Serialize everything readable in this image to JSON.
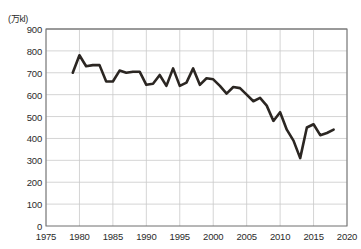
{
  "chart_data": {
    "type": "line",
    "title": "",
    "xlabel": "",
    "ylabel": "",
    "unit_label": "(万kl)",
    "xlim": [
      1975,
      2020
    ],
    "ylim": [
      0,
      900
    ],
    "grid": true,
    "legend": "none",
    "y_ticks": [
      900,
      800,
      700,
      600,
      500,
      400,
      300,
      200,
      100,
      0
    ],
    "x_ticks": [
      1975,
      1980,
      1985,
      1990,
      1995,
      2000,
      2005,
      2010,
      2015,
      2020
    ],
    "line_color": "#2b2622",
    "series": [
      {
        "name": "consumption",
        "x": [
          1979,
          1980,
          1981,
          1982,
          1983,
          1984,
          1985,
          1986,
          1987,
          1988,
          1989,
          1990,
          1991,
          1992,
          1993,
          1994,
          1995,
          1996,
          1997,
          1998,
          1999,
          2000,
          2001,
          2002,
          2003,
          2004,
          2005,
          2006,
          2007,
          2008,
          2009,
          2010,
          2011,
          2012,
          2013,
          2014,
          2015,
          2016,
          2017,
          2018
        ],
        "values": [
          700,
          780,
          730,
          735,
          735,
          660,
          660,
          710,
          700,
          705,
          705,
          645,
          650,
          690,
          640,
          720,
          640,
          655,
          720,
          645,
          675,
          670,
          640,
          605,
          635,
          630,
          600,
          570,
          585,
          550,
          480,
          520,
          440,
          390,
          310,
          450,
          465,
          415,
          425,
          440
        ]
      }
    ]
  }
}
